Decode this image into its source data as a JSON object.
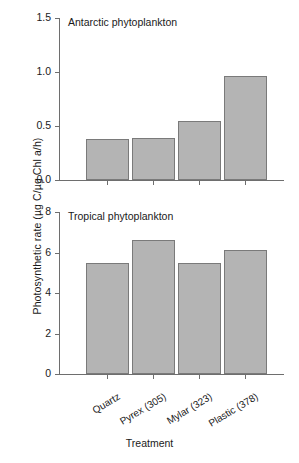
{
  "chart_data": {
    "type": "bar",
    "title": "",
    "xlabel": "Treatment",
    "ylabel": "Photosynthetic rate (µg C/µg Chl a/h)",
    "categories": [
      "Quartz",
      "Pyrex (305)",
      "Mylar (323)",
      "Plastic (378)"
    ],
    "panels": [
      {
        "title": "Antarctic phytoplankton",
        "values": [
          0.38,
          0.385,
          0.55,
          0.96
        ],
        "ylim": [
          0.0,
          1.5
        ],
        "yticks": [
          0.0,
          0.5,
          1.0,
          1.5
        ],
        "ytick_labels": [
          "0.0",
          "0.5",
          "1.0",
          "1.5"
        ],
        "grid": false
      },
      {
        "title": "Tropical phytoplankton",
        "values": [
          5.5,
          6.6,
          5.5,
          6.1
        ],
        "ylim": [
          0,
          8
        ],
        "yticks": [
          0,
          2,
          4,
          6,
          8
        ],
        "ytick_labels": [
          "0",
          "2",
          "4",
          "6",
          "8"
        ],
        "grid": false
      }
    ],
    "legend": null,
    "legend_position": "none",
    "bar_color": "#b4b4b4",
    "bar_edge_color": "#7a7a7a",
    "axis_color": "#6e6e6e",
    "text_color": "#1a1a1a"
  }
}
